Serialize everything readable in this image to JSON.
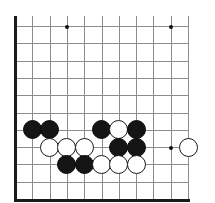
{
  "diagram": {
    "type": "go-board-position",
    "board": {
      "cols": 11,
      "rows": 11,
      "origin_x": 15,
      "origin_y": 26,
      "spacing": 17.3,
      "line_color": "#8c8c8c",
      "edge_color": "#1a1a1a",
      "background": "#ffffff",
      "edges": [
        "left",
        "bottom"
      ],
      "grid_right_x": 189,
      "grid_top_y": 16
    },
    "star_points": [
      {
        "col": 3,
        "row": 0
      },
      {
        "col": 9,
        "row": 0
      },
      {
        "col": 9,
        "row": 7
      }
    ],
    "stones": [
      {
        "color": "black",
        "col": 1,
        "row": 6
      },
      {
        "color": "black",
        "col": 2,
        "row": 6
      },
      {
        "color": "black",
        "col": 5,
        "row": 6
      },
      {
        "color": "white",
        "col": 6,
        "row": 6
      },
      {
        "color": "black",
        "col": 7,
        "row": 6
      },
      {
        "color": "white",
        "col": 2,
        "row": 7
      },
      {
        "color": "white",
        "col": 3,
        "row": 7
      },
      {
        "color": "white",
        "col": 4,
        "row": 7
      },
      {
        "color": "black",
        "col": 6,
        "row": 7
      },
      {
        "color": "black",
        "col": 7,
        "row": 7
      },
      {
        "color": "white",
        "col": 10,
        "row": 7
      },
      {
        "color": "black",
        "col": 3,
        "row": 8
      },
      {
        "color": "black",
        "col": 4,
        "row": 8
      },
      {
        "color": "white",
        "col": 5,
        "row": 8
      },
      {
        "color": "white",
        "col": 6,
        "row": 8
      },
      {
        "color": "white",
        "col": 7,
        "row": 8
      }
    ],
    "counts": {
      "black_stones": 9,
      "white_stones": 7,
      "total_stones": 16
    }
  }
}
